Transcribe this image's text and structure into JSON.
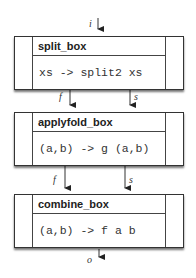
{
  "diagram": {
    "input_label": "i",
    "output_label": "o",
    "boxes": [
      {
        "title": "split_box",
        "body": "xs -> split2 xs"
      },
      {
        "title": "applyfold_box",
        "body": "(a,b) -> g (a,b)"
      },
      {
        "title": "combine_box",
        "body": "(a,b) -> f a b"
      }
    ],
    "edges": [
      {
        "from": "split_box",
        "to": "applyfold_box",
        "labels": [
          "f",
          "s"
        ]
      },
      {
        "from": "applyfold_box",
        "to": "combine_box",
        "labels": [
          "f",
          "s"
        ]
      }
    ],
    "edge_labels": {
      "e1_left": "f",
      "e1_right": "s",
      "e2_left": "f",
      "e2_right": "s"
    },
    "colors": {
      "line": "#333333",
      "background": "#ffffff"
    }
  }
}
